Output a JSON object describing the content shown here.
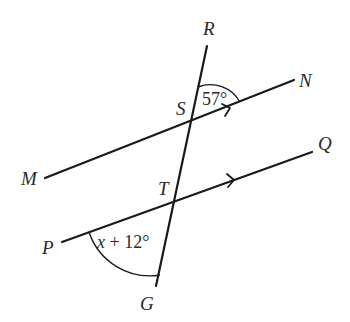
{
  "diagram": {
    "type": "parallel lines cut by a transversal",
    "points": {
      "R": "R",
      "N": "N",
      "S": "S",
      "M": "M",
      "T": "T",
      "Q": "Q",
      "P": "P",
      "G": "G"
    },
    "lines": [
      {
        "name": "MN",
        "from": "M",
        "to": "N",
        "parallel_marker": "arrow"
      },
      {
        "name": "PQ",
        "from": "P",
        "to": "Q",
        "parallel_marker": "arrow"
      },
      {
        "name": "RG",
        "from": "R",
        "to": "G",
        "role": "transversal"
      }
    ],
    "angles": {
      "angle_RSN": {
        "label": "57°",
        "vertex": "S"
      },
      "angle_PTG": {
        "label_var": "x",
        "label_rest": " + 12°",
        "vertex": "T"
      }
    },
    "colors": {
      "stroke": "#1a1a1a",
      "text": "#2a2a2a",
      "background": "#ffffff"
    }
  }
}
